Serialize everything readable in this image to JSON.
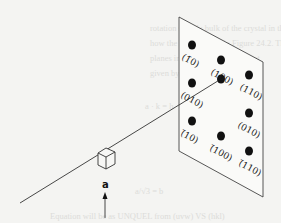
{
  "figure": {
    "beam_label": "a",
    "spots": [
      {
        "label": "(1̅0)",
        "row": 0,
        "col": 0
      },
      {
        "label": "(100)",
        "row": 0,
        "col": 1
      },
      {
        "label": "(110)",
        "row": 0,
        "col": 2
      },
      {
        "label": "(010)",
        "row": 1,
        "col": 0
      },
      {
        "label": "",
        "row": 1,
        "col": 1,
        "center": true
      },
      {
        "label": "(010)",
        "row": 1,
        "col": 2
      },
      {
        "label": "(̅110)",
        "row": 2,
        "col": 0
      },
      {
        "label": "(̅100)",
        "row": 2,
        "col": 1
      },
      {
        "label": "(̅110)",
        "row": 2,
        "col": 2
      }
    ],
    "labels": {
      "s00": "(1̄0)",
      "s01": "(100)",
      "s02": "(110)",
      "s10": "(010)",
      "s12": "(010)",
      "s20": "(̄10)",
      "s21": "(̄100)",
      "s22": "(̄110)"
    }
  },
  "bleed_through": {
    "lines": [
      "rotation sample bulk of the crystal in the",
      "how the spots shown in Figure 24.2. The",
      "planes in 3D. The rotation about",
      "given by Equation 24.4",
      "a · k = h",
      "a/√3  =  b",
      "Equation will be as UNQUEL from (uvw) VS (hkl)"
    ]
  }
}
